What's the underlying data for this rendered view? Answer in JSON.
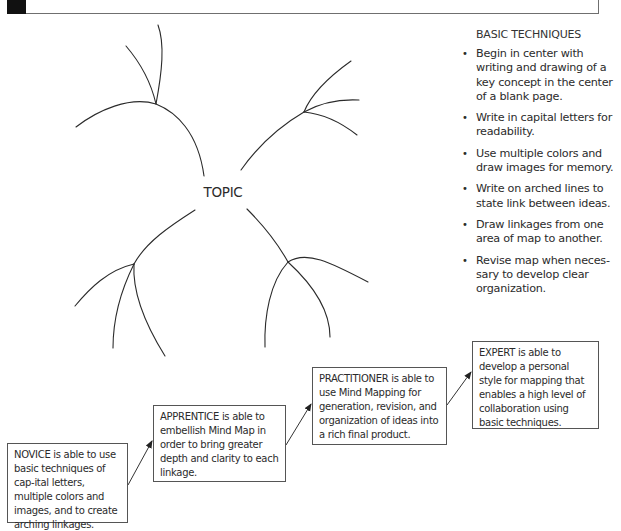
{
  "header": {
    "title": ""
  },
  "mind_map": {
    "center_label": "TOPIC",
    "branches": [
      {
        "name": "top-left",
        "main": "M204,176 C198,132 176,112 156,104 C130,96 98,110 76,127",
        "subs": [
          "M156,104 C162,72 165,44 158,25",
          "M156,104 C150,78 138,60 126,46"
        ]
      },
      {
        "name": "top-right",
        "main": "M241,170 C258,146 280,126 304,112",
        "subs": [
          "M304,112 C312,92 330,76 351,61",
          "M304,112 C322,102 340,99 359,100",
          "M304,112 C325,114 343,124 357,135"
        ]
      },
      {
        "name": "bottom-left",
        "main": "M195,210 C170,226 148,240 134,264",
        "subs": [
          "M134,264 C108,270 90,288 75,306",
          "M134,264 C120,292 113,320 113,348",
          "M134,264 C132,296 150,332 165,356"
        ]
      },
      {
        "name": "bottom-right",
        "main": "M247,209 C264,226 278,244 288,262",
        "subs": [
          "M288,262 C270,282 264,316 265,347",
          "M288,262 C306,242 320,256 368,282",
          "M288,262 C310,282 330,310 330,337"
        ]
      }
    ]
  },
  "techniques": {
    "title": "BASIC TECHNIQUES",
    "items": [
      "Begin in center with writing and drawing of a key concept in the center of a blank page.",
      "Write in capital letters for readability.",
      "Use multiple colors and draw images for memory.",
      "Write on arched lines to state link between ideas.",
      "Draw linkages from one area of map to another.",
      "Revise map when neces-sary to develop clear organization."
    ]
  },
  "levels": [
    {
      "name": "novice",
      "text": "NOVICE is able to use basic techniques of cap-ital letters, multiple colors and images, and to create arching linkages."
    },
    {
      "name": "apprentice",
      "text": "APPRENTICE is able to embellish Mind Map in order to bring greater depth and clarity to each linkage."
    },
    {
      "name": "practitioner",
      "text": "PRACTITIONER is able to use Mind Mapping for generation, revision, and organization of ideas into a rich final product."
    },
    {
      "name": "expert",
      "text": "EXPERT is able to develop a personal style for mapping that enables a high level of collaboration using basic techniques."
    }
  ],
  "colors": {
    "line": "#2b2b2b",
    "box_border": "#555555",
    "header_block": "#111111"
  }
}
